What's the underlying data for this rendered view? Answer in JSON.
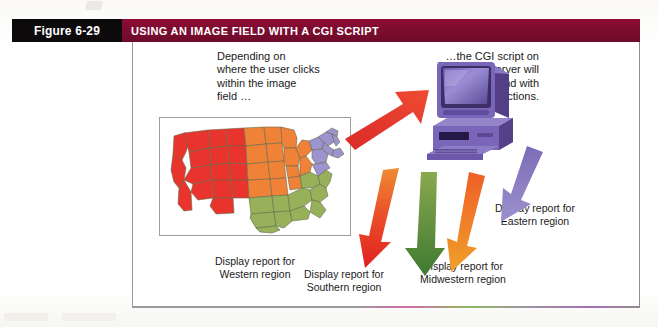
{
  "figure": {
    "number_label": "Figure 6-29",
    "title": "USING AN IMAGE FIELD WITH A CGI SCRIPT"
  },
  "callouts": {
    "left": "Depending on\nwhere the user clicks\nwithin the image\nfield …",
    "right": "…the CGI script on\nthe Web server will\nrespond with\ndifferent actions."
  },
  "image_field": {
    "alt": "united-states-map-image-field",
    "regions": [
      {
        "name": "Western",
        "color": "#e8342c"
      },
      {
        "name": "Midwestern",
        "color": "#f08238"
      },
      {
        "name": "Southern",
        "color": "#96b159"
      },
      {
        "name": "Eastern",
        "color": "#9d93cf"
      }
    ]
  },
  "server": {
    "alt": "web-server-computer",
    "color": "#7a5fb5"
  },
  "arrows": {
    "click": {
      "name": "click-arrow-to-server",
      "color": "#e23c2e"
    },
    "responses": [
      {
        "name": "western-arrow",
        "color": "#e2392c"
      },
      {
        "name": "southern-arrow",
        "color": "#4e8a3a"
      },
      {
        "name": "midwestern-arrow",
        "color": "#f08a2a"
      },
      {
        "name": "eastern-arrow",
        "color": "#9a8ecb"
      }
    ]
  },
  "region_reports": [
    {
      "id": "eastern",
      "text": "Display report for\nEastern region"
    },
    {
      "id": "western",
      "text": "Display report for\nWestern region"
    },
    {
      "id": "southern",
      "text": "Display report for\nSouthern region"
    },
    {
      "id": "midwestern",
      "text": "Display report for\nMidwestern region"
    }
  ]
}
